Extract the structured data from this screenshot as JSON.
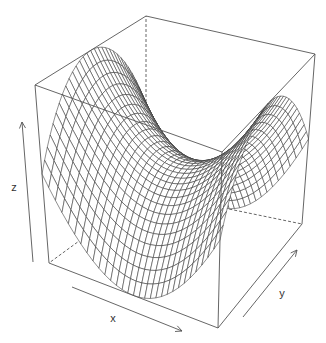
{
  "chart_data": {
    "type": "surface",
    "title": "",
    "function": "z = x^2 - y^2",
    "xlabel": "x",
    "ylabel": "y",
    "zlabel": "z",
    "x_range": [
      -1,
      1
    ],
    "y_range": [
      -1,
      1
    ],
    "z_range": [
      -1,
      1
    ],
    "grid_x": 30,
    "grid_y": 30,
    "box": true,
    "ticks": false,
    "line_color": "#333333",
    "face_color": "#ffffff",
    "box_color": "#555555"
  },
  "projection": {
    "corners": {
      "x0y0z0": [
        49,
        263
      ],
      "x1y0z0": [
        218,
        328
      ],
      "x0y1z0": [
        146,
        192
      ],
      "x1y1z0": [
        302,
        224
      ],
      "x0y0z1": [
        35,
        85
      ],
      "x1y0z1": [
        222,
        152
      ],
      "x0y1z1": [
        146,
        16
      ],
      "x1y1z1": [
        315,
        54
      ]
    }
  },
  "axes": {
    "z_arrow": {
      "from": [
        33,
        262
      ],
      "to": [
        22,
        122
      ],
      "label_pos": [
        14,
        191
      ]
    },
    "x_arrow": {
      "from": [
        72,
        287
      ],
      "to": [
        182,
        331
      ],
      "label_pos": [
        113,
        322
      ]
    },
    "y_arrow": {
      "from": [
        243,
        317
      ],
      "to": [
        297,
        250
      ],
      "label_pos": [
        282,
        297
      ]
    }
  }
}
